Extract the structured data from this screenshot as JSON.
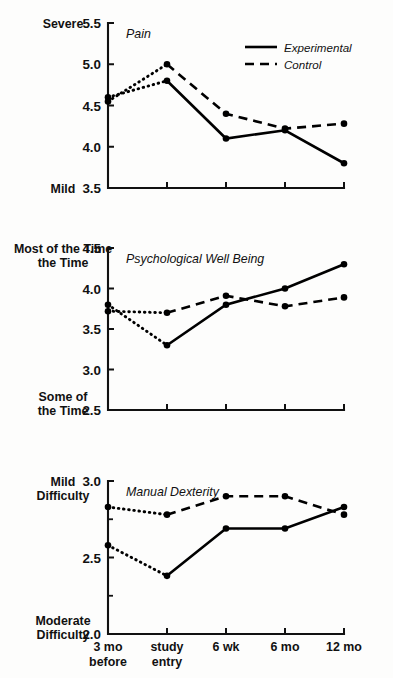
{
  "figure": {
    "width": 393,
    "height": 678,
    "background": "#fdfdfc",
    "ink_color": "#000000"
  },
  "legend": {
    "position": "top-right of first panel",
    "entries": [
      {
        "label": "Experimental",
        "style": "solid"
      },
      {
        "label": "Control",
        "style": "dashed"
      }
    ]
  },
  "x_axis": {
    "categories": [
      "3 mo\nbefore",
      "study\nentry",
      "6 wk",
      "6 mo",
      "12 mo"
    ],
    "tick_labels": [
      {
        "line1": "3 mo",
        "line2": "before"
      },
      {
        "line1": "study",
        "line2": "entry"
      },
      {
        "line1": "6 wk",
        "line2": ""
      },
      {
        "line1": "6 mo",
        "line2": ""
      },
      {
        "line1": "12 mo",
        "line2": ""
      }
    ]
  },
  "chart_data": [
    {
      "type": "line",
      "title": "Pain",
      "xlabel": "",
      "ylabel": "",
      "y_axis_top_label": "Severe",
      "y_axis_bottom_label": "Mild",
      "categories": [
        "3 mo before",
        "study entry",
        "6 wk",
        "6 mo",
        "12 mo"
      ],
      "ylim": [
        3.5,
        5.5
      ],
      "yticks": [
        3.5,
        4.0,
        4.5,
        5.0,
        5.5
      ],
      "ytick_labels": [
        "3.5",
        "4.0",
        "4.5",
        "5.0",
        "5.5"
      ],
      "grid": false,
      "series": [
        {
          "name": "Experimental",
          "style": "solid",
          "baseline_style": "dotted",
          "values": [
            4.6,
            4.8,
            4.1,
            4.2,
            3.8
          ]
        },
        {
          "name": "Control",
          "style": "dashed",
          "baseline_style": "dotted",
          "values": [
            4.55,
            5.0,
            4.4,
            4.22,
            4.28
          ]
        }
      ]
    },
    {
      "type": "line",
      "title": "Psychological Well Being",
      "xlabel": "",
      "ylabel": "",
      "y_axis_top_label": "Most of\nthe Time",
      "y_axis_top_label_line1": "Most of",
      "y_axis_top_label_line2": "the Time",
      "y_axis_bottom_label_line1": "Some of",
      "y_axis_bottom_label_line2": "the Time",
      "categories": [
        "3 mo before",
        "study entry",
        "6 wk",
        "6 mo",
        "12 mo"
      ],
      "ylim": [
        2.5,
        4.5
      ],
      "yticks": [
        2.5,
        3.0,
        3.5,
        4.0,
        4.5
      ],
      "ytick_labels": [
        "2.5",
        "3.0",
        "3.5",
        "4.0",
        "4.5"
      ],
      "grid": false,
      "series": [
        {
          "name": "Experimental",
          "style": "solid",
          "baseline_style": "dotted",
          "values": [
            3.8,
            3.3,
            3.8,
            4.0,
            4.3
          ]
        },
        {
          "name": "Control",
          "style": "dashed",
          "baseline_style": "dotted",
          "values": [
            3.72,
            3.7,
            3.91,
            3.78,
            3.89
          ]
        }
      ]
    },
    {
      "type": "line",
      "title": "Manual Dexterity",
      "xlabel": "",
      "ylabel": "",
      "y_axis_top_label_line1": "Mild",
      "y_axis_top_label_line2": "Difficulty",
      "y_axis_bottom_label_line1": "Moderate",
      "y_axis_bottom_label_line2": "Difficulty",
      "categories": [
        "3 mo before",
        "study entry",
        "6 wk",
        "6 mo",
        "12 mo"
      ],
      "ylim": [
        2.0,
        3.0
      ],
      "yticks": [
        2.0,
        2.5,
        3.0
      ],
      "ytick_labels": [
        "2.0",
        "2.5",
        "3.0"
      ],
      "minor_yticks": [
        2.25,
        2.75
      ],
      "grid": false,
      "series": [
        {
          "name": "Experimental",
          "style": "solid",
          "baseline_style": "dotted",
          "values": [
            2.58,
            2.38,
            2.69,
            2.69,
            2.83
          ]
        },
        {
          "name": "Control",
          "style": "dashed",
          "baseline_style": "dotted",
          "values": [
            2.83,
            2.78,
            2.9,
            2.9,
            2.78
          ]
        }
      ]
    }
  ]
}
